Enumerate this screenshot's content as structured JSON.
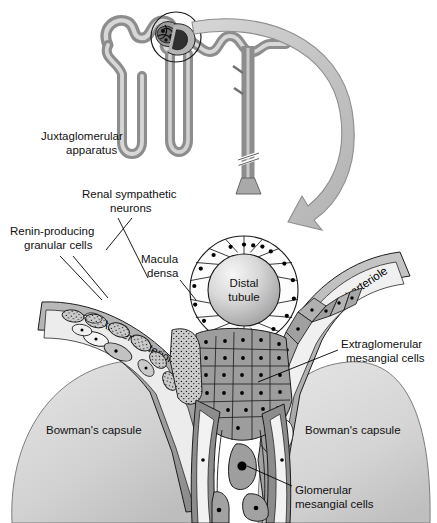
{
  "figure": {
    "background_color": "#ffffff",
    "width": 437,
    "height": 523
  },
  "labels": {
    "juxtaglomerular_apparatus_line1": "Juxtaglomerular",
    "juxtaglomerular_apparatus_line2": "apparatus",
    "renal_sympathetic_neurons_line1": "Renal sympathetic",
    "renal_sympathetic_neurons_line2": "neurons",
    "renin_producing_granular_cells_line1": "Renin-producing",
    "renin_producing_granular_cells_line2": "granular cells",
    "macula_densa_line1": "Macula",
    "macula_densa_line2": "densa",
    "distal_tubule_line1": "Distal",
    "distal_tubule_line2": "tubule",
    "afferent_arteriole": "Afferent arteriole",
    "efferent_arteriole": "Efferent arteriole",
    "extraglomerular_mesangial_cells_line1": "Extraglomerular",
    "extraglomerular_mesangial_cells_line2": "mesangial cells",
    "bowmans_capsule_left": "Bowman's capsule",
    "bowmans_capsule_right": "Bowman's capsule",
    "glomerular_mesangial_cells_line1": "Glomerular",
    "glomerular_mesangial_cells_line2": "mesangial cells"
  },
  "colors": {
    "background": "#ffffff",
    "outline": "#000000",
    "text": "#111111",
    "arrow_fill": "#c9c9c9",
    "arrow_stroke": "#8a8a8a",
    "bowmans_capsule_light": "#dcdcdc",
    "bowmans_capsule_dark": "#b6b6b6",
    "distal_tubule_light": "#f2f2f2",
    "distal_tubule_dark": "#9a9a9a",
    "macula_densa_cell": "#fdfdfd",
    "granular_cell": "#c0c0c0",
    "extraglomerular_mesangial": "#9e9e9e",
    "glomerular_mesangial": "#a8a8a8",
    "arteriole_wall_dark": "#8f8f8f",
    "arteriole_wall_light": "#cfcfcf",
    "tubule_wall": "#8c8c8c",
    "tubule_lumen": "#d5d5d5",
    "nucleus": "#000000"
  },
  "structures": {
    "nephron_schematic": {
      "name": "nephron-schematic",
      "parts": [
        "proximal convoluted tubule",
        "glomerulus",
        "loop of Henle",
        "distal convoluted tubule",
        "collecting duct"
      ],
      "highlight_circle": true
    },
    "magnifier_arrow": {
      "name": "magnification-arrow",
      "direction": "clockwise-down-left"
    },
    "macula_densa_cell_count": 18,
    "granular_cell_count": 9,
    "extraglomerular_mesangial_cell_count": 26,
    "glomerular_mesangial_cell_count": 3
  }
}
